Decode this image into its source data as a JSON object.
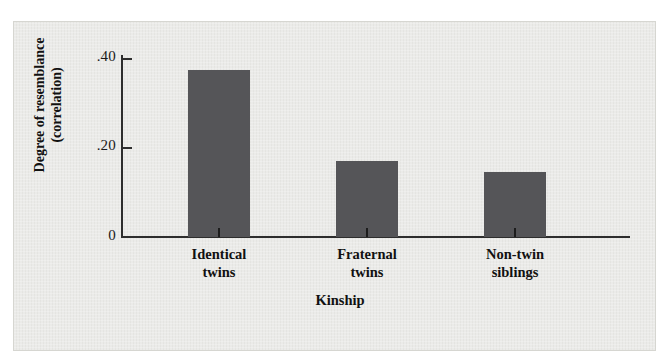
{
  "chart_data": {
    "type": "bar",
    "title": "",
    "xlabel": "Kinship",
    "ylabel": "Degree of resemblance (correlation)",
    "ylabel_line1": "Degree of resemblance",
    "ylabel_line2": "(correlation)",
    "categories": [
      "Identical twins",
      "Fraternal twins",
      "Non-twin siblings"
    ],
    "category_lines": [
      {
        "line1": "Identical",
        "line2": "twins"
      },
      {
        "line1": "Fraternal",
        "line2": "twins"
      },
      {
        "line1": "Non-twin",
        "line2": "siblings"
      }
    ],
    "values": [
      0.375,
      0.17,
      0.145
    ],
    "ylim": [
      0,
      0.45
    ],
    "ytick_values": [
      0,
      0.2,
      0.4
    ],
    "ytick_labels": [
      "0",
      ".20",
      ".40"
    ],
    "grid": false,
    "legend": false,
    "bar_color": "#555558",
    "axis_color": "#2e2e2e",
    "background_color": "#e9e9e6"
  },
  "axis": {
    "y_labels": {
      "top": ".40",
      "mid": ".20",
      "zero": "0"
    },
    "y_title_line1": "Degree of resemblance",
    "y_title_line2": "(correlation)",
    "x_title": "Kinship"
  },
  "bars": [
    {
      "label_line1": "Identical",
      "label_line2": "twins",
      "value": 0.375
    },
    {
      "label_line1": "Fraternal",
      "label_line2": "twins",
      "value": 0.17
    },
    {
      "label_line1": "Non-twin",
      "label_line2": "siblings",
      "value": 0.145
    }
  ]
}
